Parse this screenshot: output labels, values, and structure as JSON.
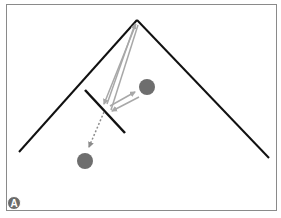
{
  "figure": {
    "panel_label": "A",
    "colors": {
      "line": "#111111",
      "arrow": "#a8a8a8",
      "dot": "#6e6e6e",
      "frame": "#8a8a8a"
    },
    "roof": {
      "peak": [
        137,
        20
      ],
      "left_end": [
        19,
        152
      ],
      "right_end": [
        269,
        158
      ]
    },
    "barrier": {
      "start": [
        85,
        90
      ],
      "end": [
        125,
        133
      ]
    },
    "circles": [
      {
        "name": "upper-circle",
        "center": [
          147,
          87
        ],
        "radius": 8
      },
      {
        "name": "lower-circle",
        "center": [
          85,
          161
        ],
        "radius": 8
      }
    ]
  }
}
